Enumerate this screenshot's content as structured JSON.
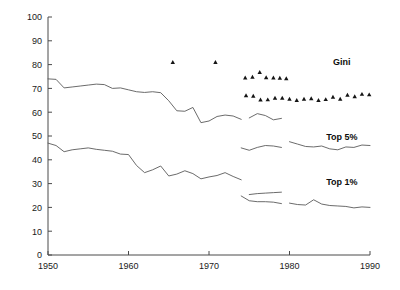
{
  "chart_data": {
    "type": "line",
    "title": "",
    "subtitle": "",
    "xlabel": "",
    "ylabel": "",
    "xlim": [
      1950,
      1990
    ],
    "ylim": [
      0,
      100
    ],
    "xticks": [
      1950,
      1960,
      1970,
      1980,
      1990
    ],
    "yticks": [
      0,
      10,
      20,
      30,
      40,
      50,
      60,
      70,
      80,
      90,
      100
    ],
    "grid": false,
    "legend_position": "inline-annotations",
    "annotations": [
      {
        "text": "Gini",
        "x": 1986.5,
        "y": 80
      },
      {
        "text": "Top 5%",
        "x": 1986.5,
        "y": 48.5
      },
      {
        "text": "Top 1%",
        "x": 1986.5,
        "y": 29.5
      }
    ],
    "series": [
      {
        "name": "Top 5%",
        "marker": "none",
        "style": "line",
        "segments": [
          {
            "x": [
              1950,
              1951,
              1952,
              1953,
              1954,
              1955,
              1956,
              1957,
              1958,
              1959,
              1960,
              1961,
              1962,
              1963,
              1964,
              1965,
              1966,
              1967,
              1968,
              1969,
              1970,
              1971,
              1972,
              1973,
              1974
            ],
            "y": [
              74.0,
              73.8,
              70.2,
              70.6,
              71.0,
              71.4,
              71.8,
              71.6,
              70.0,
              70.2,
              69.4,
              68.6,
              68.3,
              68.6,
              68.2,
              64.8,
              60.6,
              60.4,
              62.0,
              55.6,
              56.3,
              58.2,
              58.8,
              58.4,
              57.0
            ]
          },
          {
            "x": [
              1975,
              1976,
              1977,
              1978,
              1979
            ],
            "y": [
              57.6,
              59.4,
              58.6,
              56.8,
              57.4
            ]
          },
          {
            "x": [
              1974,
              1975,
              1976,
              1977,
              1978,
              1979
            ],
            "y": [
              45.0,
              44.0,
              45.2,
              46.0,
              45.8,
              45.2
            ]
          },
          {
            "x": [
              1980,
              1981,
              1982,
              1983,
              1984,
              1985,
              1986,
              1987,
              1988,
              1989,
              1990
            ],
            "y": [
              47.6,
              46.6,
              45.6,
              45.4,
              45.8,
              44.6,
              44.2,
              45.4,
              45.2,
              46.2,
              46.0
            ]
          }
        ]
      },
      {
        "name": "Top 1%",
        "marker": "none",
        "style": "line",
        "segments": [
          {
            "x": [
              1950,
              1951,
              1952,
              1953,
              1954,
              1955,
              1956,
              1957,
              1958,
              1959,
              1960,
              1961,
              1962,
              1963,
              1964,
              1965,
              1966,
              1967,
              1968,
              1969,
              1970,
              1971,
              1972,
              1973,
              1974
            ],
            "y": [
              47.0,
              46.0,
              43.4,
              44.2,
              44.6,
              45.0,
              44.4,
              44.0,
              43.6,
              42.4,
              42.2,
              37.6,
              34.6,
              35.8,
              37.4,
              33.2,
              34.0,
              35.4,
              34.2,
              32.0,
              32.8,
              33.4,
              34.6,
              33.0,
              31.6
            ]
          },
          {
            "x": [
              1975,
              1976,
              1977,
              1978,
              1979
            ],
            "y": [
              25.4,
              25.8,
              26.0,
              26.2,
              26.4
            ]
          },
          {
            "x": [
              1974,
              1975,
              1976,
              1977,
              1978,
              1979
            ],
            "y": [
              24.8,
              22.8,
              22.4,
              22.4,
              22.2,
              21.6
            ]
          },
          {
            "x": [
              1980,
              1981,
              1982,
              1983,
              1984,
              1985,
              1986,
              1987,
              1988,
              1989,
              1990
            ],
            "y": [
              21.8,
              21.2,
              21.0,
              23.2,
              21.4,
              20.8,
              20.6,
              20.4,
              19.8,
              20.2,
              20.0
            ]
          }
        ]
      },
      {
        "name": "Gini",
        "marker": "triangle",
        "style": "scatter",
        "groups": [
          {
            "label": "isolated-high",
            "x": [
              1965.5,
              1970.8
            ],
            "y": [
              81.0,
              81.0
            ]
          },
          {
            "label": "upper-cluster",
            "x": [
              1974.5,
              1975.4,
              1976.3,
              1977.1,
              1978.0,
              1978.8,
              1979.6
            ],
            "y": [
              74.5,
              74.8,
              76.8,
              74.6,
              74.5,
              74.4,
              74.2
            ]
          },
          {
            "label": "lower-run",
            "x": [
              1974.6,
              1975.5,
              1976.4,
              1977.3,
              1978.2,
              1979.1,
              1980.0,
              1980.9,
              1981.8,
              1982.7,
              1983.6,
              1984.5,
              1985.4,
              1986.3,
              1987.2,
              1988.1,
              1989.0,
              1989.9
            ],
            "y": [
              67.0,
              66.8,
              65.2,
              65.3,
              66.0,
              66.0,
              65.6,
              65.0,
              65.6,
              65.8,
              65.0,
              65.4,
              66.4,
              65.6,
              67.2,
              66.6,
              67.6,
              67.4
            ]
          }
        ]
      }
    ]
  },
  "axes": {
    "y_tick_labels": [
      "0",
      "10",
      "20",
      "30",
      "40",
      "50",
      "60",
      "70",
      "80",
      "90",
      "100"
    ],
    "x_tick_labels": [
      "1950",
      "1960",
      "1970",
      "1980",
      "1990"
    ]
  },
  "labels": {
    "gini": "Gini",
    "top5": "Top 5%",
    "top1": "Top 1%"
  },
  "colors": {
    "line": "#5a5a5a",
    "axis": "#4a4a4a",
    "marker": "#141414",
    "text": "#1a1a1a",
    "background": "#ffffff"
  }
}
